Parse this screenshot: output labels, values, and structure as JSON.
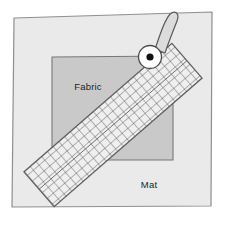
{
  "figure": {
    "width": 227,
    "height": 225,
    "background_color": "#ffffff"
  },
  "labels": {
    "fabric": "Fabric",
    "mat": "Mat"
  },
  "colors": {
    "page_background": "#ffffff",
    "mat_fill": "#eaeaea",
    "mat_stroke": "#8f8f8f",
    "fabric_fill": "#c9c9c9",
    "fabric_stroke": "#777777",
    "ruler_fill": "#efefef",
    "ruler_stroke": "#606060",
    "ruler_grid": "#5a5a5a",
    "cutter_blade_fill": "#ffffff",
    "cutter_blade_stroke": "#4a4a4a",
    "cutter_axle_fill": "#111111",
    "cutter_handle_fill": "#dcdcdc",
    "cutter_handle_stroke": "#5a5a5a",
    "label_text": "#1f1f1f"
  },
  "geometry": {
    "mat_points": "14,18 212,12 211,206 12,207",
    "fabric_points": "52,57 173,56 173,160 52,160",
    "ruler": {
      "center_x": 113,
      "center_y": 125,
      "length": 196,
      "width": 46,
      "rotation_deg": -41,
      "grid_cell_px": 7.6
    },
    "cutter": {
      "blade_center_x": 150,
      "blade_center_y": 57,
      "blade_radius": 11.5,
      "axle_radius": 3.6,
      "handle_points": "155,49 163,20 170,14 176,17 175,26 166,52"
    },
    "fabric_label_x": 88,
    "fabric_label_y": 90,
    "mat_label_x": 149,
    "mat_label_y": 188
  }
}
